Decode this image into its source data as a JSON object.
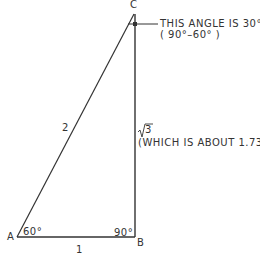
{
  "diagram": {
    "vertices": {
      "A": "A",
      "B": "B",
      "C": "C"
    },
    "angles": {
      "A": "60°",
      "B": "90°"
    },
    "sides": {
      "hypotenuse_AC": "2",
      "base_AB": "1",
      "vertical_BC": "√3"
    },
    "annotations": {
      "angle_c_line1": "THIS ANGLE IS 30°",
      "angle_c_line2": "( 90°–60° )",
      "bc_note": "(WHICH IS ABOUT 1.73)"
    },
    "colors": {
      "stroke": "#333333",
      "background": "#ffffff"
    }
  }
}
